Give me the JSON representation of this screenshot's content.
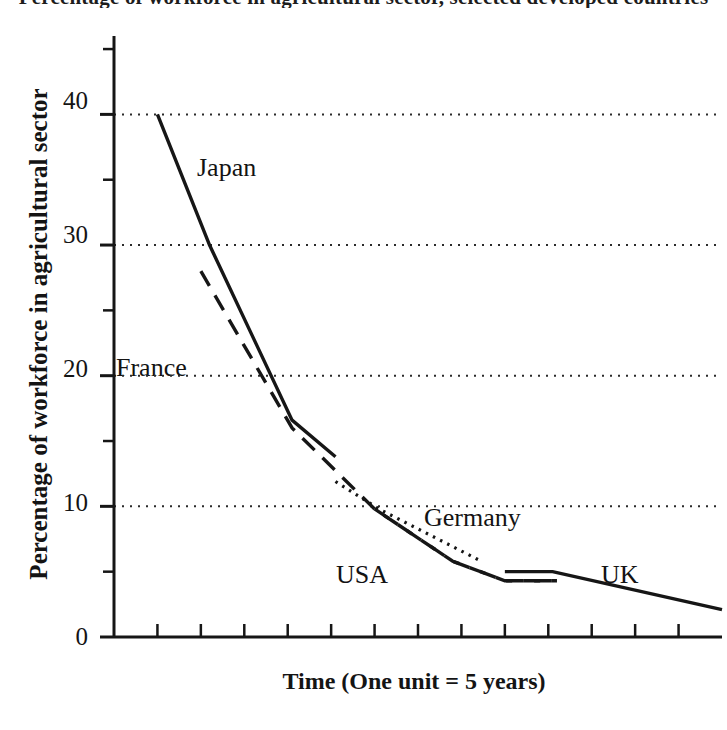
{
  "title": "Percentage of workforce in agricultural sector, selected developed countries",
  "axes": {
    "ylabel": "Percentage of workforce in agricultural sector",
    "xlabel": "Time (One unit = 5 years)",
    "ytick_labels": [
      "40",
      "30",
      "20",
      "10",
      "0"
    ],
    "ytick_values": [
      40,
      30,
      20,
      10,
      0
    ],
    "yminor_values": [
      45,
      35,
      25,
      15,
      5
    ],
    "ylim": [
      0,
      46
    ],
    "xlim": [
      0,
      14
    ],
    "xtick_count": 13,
    "grid": "horizontal-dotted-at-major-y"
  },
  "labels": {
    "japan": "Japan",
    "france": "France",
    "germany": "Germany",
    "usa": "USA",
    "uk": "UK"
  },
  "colors": {
    "ink": "#161616",
    "background": "#ffffff",
    "gridline": "#2b2b2b"
  },
  "chart_data": {
    "type": "line",
    "title": "Percentage of workforce in agricultural sector, selected developed countries",
    "xlabel": "Time (One unit = 5 years)",
    "ylabel": "Percentage of workforce in agricultural sector",
    "xlim": [
      0,
      14
    ],
    "ylim": [
      0,
      46
    ],
    "yticks": [
      0,
      10,
      20,
      30,
      40
    ],
    "grid": true,
    "legend": "inline-annotations",
    "series": [
      {
        "name": "Japan",
        "style": "solid",
        "points": [
          {
            "x": 1.0,
            "y": 40.0
          },
          {
            "x": 2.2,
            "y": 30.0
          },
          {
            "x": 4.1,
            "y": 16.6
          },
          {
            "x": 5.1,
            "y": 13.8
          }
        ]
      },
      {
        "name": "France",
        "style": "dashed",
        "points": [
          {
            "x": 2.0,
            "y": 28.0
          },
          {
            "x": 4.1,
            "y": 16.0
          },
          {
            "x": 6.0,
            "y": 9.8
          },
          {
            "x": 7.8,
            "y": 5.8
          },
          {
            "x": 9.0,
            "y": 4.3
          },
          {
            "x": 10.2,
            "y": 4.3
          }
        ]
      },
      {
        "name": "Germany",
        "style": "dotted",
        "points": [
          {
            "x": 5.1,
            "y": 11.9
          },
          {
            "x": 6.1,
            "y": 9.8
          },
          {
            "x": 8.4,
            "y": 5.9
          }
        ]
      },
      {
        "name": "USA",
        "style": "dashed",
        "points": [
          {
            "x": 6.0,
            "y": 9.8
          },
          {
            "x": 7.8,
            "y": 5.8
          },
          {
            "x": 9.0,
            "y": 4.3
          },
          {
            "x": 10.2,
            "y": 4.3
          }
        ]
      },
      {
        "name": "UK",
        "style": "solid",
        "points": [
          {
            "x": 9.0,
            "y": 5.0
          },
          {
            "x": 10.1,
            "y": 5.0
          },
          {
            "x": 14.0,
            "y": 2.1
          }
        ]
      }
    ],
    "annotations": [
      {
        "text": "Japan",
        "x": 2.2,
        "y": 35.2
      },
      {
        "text": "France",
        "x": 0.3,
        "y": 20.9
      },
      {
        "text": "Germany",
        "x": 7.5,
        "y": 9.0
      },
      {
        "text": "USA",
        "x": 5.5,
        "y": 4.8
      },
      {
        "text": "UK",
        "x": 12.2,
        "y": 4.8
      }
    ]
  }
}
